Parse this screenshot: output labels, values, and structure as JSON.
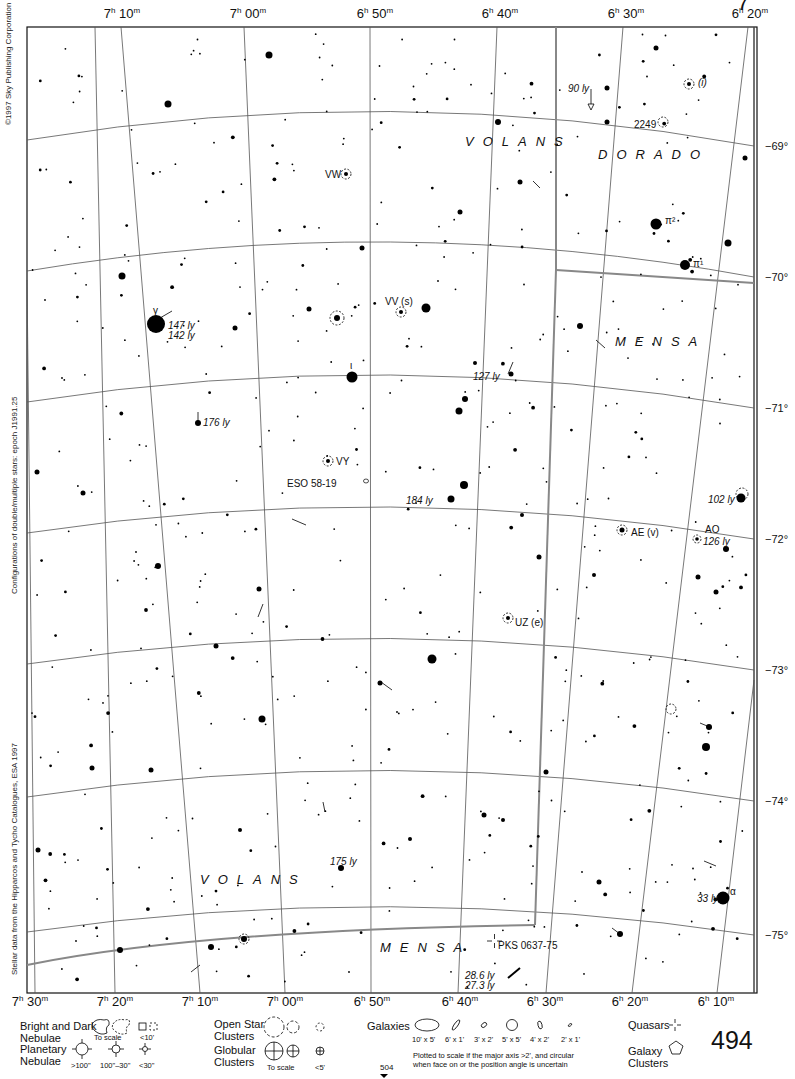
{
  "chart": {
    "page_number": "494",
    "continued_page": "504",
    "top_marker": "7",
    "ra_labels_top": [
      {
        "h": "7",
        "m": "10",
        "x": 122
      },
      {
        "h": "7",
        "m": "00",
        "x": 248
      },
      {
        "h": "6",
        "m": "50",
        "x": 375
      },
      {
        "h": "6",
        "m": "40",
        "x": 500
      },
      {
        "h": "6",
        "m": "30",
        "x": 626
      },
      {
        "h": "6",
        "m": "20",
        "x": 750
      }
    ],
    "ra_labels_bottom": [
      {
        "h": "7",
        "m": "30",
        "x": 30
      },
      {
        "h": "7",
        "m": "20",
        "x": 115
      },
      {
        "h": "7",
        "m": "10",
        "x": 200
      },
      {
        "h": "7",
        "m": "00",
        "x": 285
      },
      {
        "h": "6",
        "m": "50",
        "x": 372
      },
      {
        "h": "6",
        "m": "40",
        "x": 460
      },
      {
        "h": "6",
        "m": "30",
        "x": 545
      },
      {
        "h": "6",
        "m": "20",
        "x": 630
      },
      {
        "h": "6",
        "m": "10",
        "x": 716
      }
    ],
    "dec_labels": [
      {
        "text": "−69°",
        "y": 146
      },
      {
        "text": "−70°",
        "y": 277
      },
      {
        "text": "−71°",
        "y": 408
      },
      {
        "text": "−72°",
        "y": 539
      },
      {
        "text": "−73°",
        "y": 670
      },
      {
        "text": "−74°",
        "y": 801
      },
      {
        "text": "−75°",
        "y": 935
      }
    ],
    "credits": {
      "copyright": "©1997 Sky Publishing Corporation",
      "double_stars": "Configurations of double/multiple stars: epoch J1991.25",
      "stellar_data": "Stellar data from the Hipparcos and Tycho Catalogues, ESA 1997"
    },
    "constellations": [
      {
        "name": "VOLANS",
        "x": 465,
        "y": 134
      },
      {
        "name": "DORADO",
        "x": 598,
        "y": 147
      },
      {
        "name": "MENSA",
        "x": 615,
        "y": 334
      },
      {
        "name": "VOLANS",
        "x": 200,
        "y": 872
      },
      {
        "name": "MENSA",
        "x": 380,
        "y": 940
      }
    ],
    "labels": [
      {
        "text": "90 ly",
        "x": 568,
        "y": 83,
        "italic": true
      },
      {
        "text": "(i)",
        "x": 698,
        "y": 77,
        "italic": true
      },
      {
        "text": "2249",
        "x": 634,
        "y": 119,
        "italic": false
      },
      {
        "text": "VW",
        "x": 325,
        "y": 169,
        "italic": false
      },
      {
        "text": "π²",
        "x": 665,
        "y": 215,
        "italic": false
      },
      {
        "text": "π¹",
        "x": 693,
        "y": 258,
        "italic": false
      },
      {
        "text": "VV (s)",
        "x": 385,
        "y": 296,
        "italic": false
      },
      {
        "text": "γ",
        "x": 153,
        "y": 305,
        "italic": false
      },
      {
        "text": "147 ly",
        "x": 168,
        "y": 320,
        "italic": true
      },
      {
        "text": "142 ly",
        "x": 168,
        "y": 330,
        "italic": true
      },
      {
        "text": "ι",
        "x": 350,
        "y": 360,
        "italic": false
      },
      {
        "text": "127 ly",
        "x": 473,
        "y": 371,
        "italic": true
      },
      {
        "text": "176 ly",
        "x": 203,
        "y": 417,
        "italic": true
      },
      {
        "text": "VY",
        "x": 336,
        "y": 456,
        "italic": false
      },
      {
        "text": "ESO 58-19",
        "x": 287,
        "y": 478,
        "italic": false
      },
      {
        "text": "184 ly",
        "x": 406,
        "y": 495,
        "italic": true
      },
      {
        "text": "102 ly",
        "x": 708,
        "y": 494,
        "italic": true
      },
      {
        "text": "AE (v)",
        "x": 631,
        "y": 527,
        "italic": false
      },
      {
        "text": "AO",
        "x": 705,
        "y": 524,
        "italic": false
      },
      {
        "text": "126 ly",
        "x": 703,
        "y": 536,
        "italic": true
      },
      {
        "text": "UZ (e)",
        "x": 515,
        "y": 617,
        "italic": false
      },
      {
        "text": "175 ly",
        "x": 330,
        "y": 856,
        "italic": true
      },
      {
        "text": "33 ly",
        "x": 697,
        "y": 893,
        "italic": true
      },
      {
        "text": "α",
        "x": 730,
        "y": 886,
        "italic": false
      },
      {
        "text": "PKS 0637-75",
        "x": 498,
        "y": 940,
        "italic": false
      },
      {
        "text": "28.6 ly",
        "x": 465,
        "y": 970,
        "italic": true
      },
      {
        "text": "27.3 ly",
        "x": 465,
        "y": 980,
        "italic": true
      }
    ]
  },
  "legend": {
    "nebulae": {
      "title1": "Bright and Dark",
      "title2": "Nebulae",
      "to_scale": "To scale",
      "small": "<10'"
    },
    "planetary": {
      "title1": "Planetary",
      "title2": "Nebulae",
      "sizes": [
        ">100\"",
        "100\"–30\"",
        "<30\""
      ]
    },
    "open_clusters": {
      "title1": "Open Star",
      "title2": "Clusters"
    },
    "globular": {
      "title1": "Globular",
      "title2": "Clusters",
      "to_scale": "To scale",
      "small": "<5'"
    },
    "galaxies": {
      "title": "Galaxies",
      "sizes": [
        "10' x 5'",
        "6' x 1'",
        "3' x 2'",
        "5' x 5'",
        "4' x 2'",
        "2' x 1'"
      ],
      "note1": "Plotted to scale if the major axis >2', and circular",
      "note2": "when face on or the position angle is uncertain"
    },
    "quasars": {
      "title": "Quasars"
    },
    "galaxy_clusters": {
      "title1": "Galaxy",
      "title2": "Clusters"
    }
  }
}
